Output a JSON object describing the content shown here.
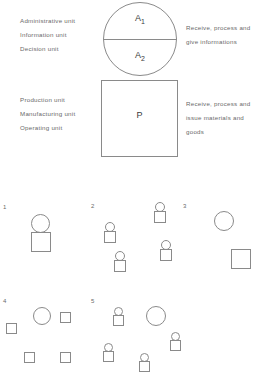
{
  "diagram": {
    "title_shapes": {
      "circle_top_label": "A",
      "circle_top_sub": "1",
      "circle_bottom_label": "A",
      "circle_bottom_sub": "2",
      "square_label": "P"
    },
    "annotations": {
      "left_top": [
        "Administrative unit",
        "Information unit",
        "Decision  unit"
      ],
      "left_bottom": [
        "Production  unit",
        "Manufacturing unit",
        "Operating   unit"
      ],
      "right_top": [
        "Receive, process and",
        "give informations"
      ],
      "right_bottom": [
        "Receive, process and",
        "issue materials and",
        "goods"
      ]
    },
    "colors": {
      "stroke": "#8a8a8a",
      "text": "#6a6a6a",
      "label_text": "#3a3a3a",
      "background": "#ffffff"
    },
    "configurations": [
      {
        "number": "1",
        "num_x": 3,
        "num_y": 14,
        "shapes": [
          {
            "type": "circle",
            "x": 31,
            "y": 24,
            "w": 19,
            "h": 19
          },
          {
            "type": "square",
            "x": 31,
            "y": 42,
            "w": 20,
            "h": 20
          }
        ]
      },
      {
        "number": "2",
        "num_x": 91,
        "num_y": 13,
        "shapes": [
          {
            "type": "circle",
            "x": 155,
            "y": 12,
            "w": 10,
            "h": 10
          },
          {
            "type": "square",
            "x": 154,
            "y": 21,
            "w": 12,
            "h": 12
          },
          {
            "type": "circle",
            "x": 105,
            "y": 32,
            "w": 10,
            "h": 10
          },
          {
            "type": "square",
            "x": 104,
            "y": 41,
            "w": 12,
            "h": 12
          },
          {
            "type": "circle",
            "x": 161,
            "y": 50,
            "w": 10,
            "h": 10
          },
          {
            "type": "square",
            "x": 160,
            "y": 59,
            "w": 12,
            "h": 12
          },
          {
            "type": "circle",
            "x": 115,
            "y": 61,
            "w": 10,
            "h": 10
          },
          {
            "type": "square",
            "x": 114,
            "y": 70,
            "w": 12,
            "h": 12
          }
        ]
      },
      {
        "number": "3",
        "num_x": 183,
        "num_y": 13,
        "shapes": [
          {
            "type": "circle",
            "x": 214,
            "y": 21,
            "w": 20,
            "h": 20
          },
          {
            "type": "square",
            "x": 231,
            "y": 59,
            "w": 20,
            "h": 20
          }
        ]
      },
      {
        "number": "4",
        "num_x": 3,
        "num_y": 108,
        "shapes": [
          {
            "type": "circle",
            "x": 33,
            "y": 117,
            "w": 18,
            "h": 18
          },
          {
            "type": "square",
            "x": 60,
            "y": 122,
            "w": 11,
            "h": 11
          },
          {
            "type": "square",
            "x": 6,
            "y": 133,
            "w": 11,
            "h": 11
          },
          {
            "type": "square",
            "x": 24,
            "y": 162,
            "w": 11,
            "h": 11
          },
          {
            "type": "square",
            "x": 60,
            "y": 162,
            "w": 11,
            "h": 11
          }
        ]
      },
      {
        "number": "5",
        "num_x": 91,
        "num_y": 108,
        "shapes": [
          {
            "type": "circle",
            "x": 146,
            "y": 116,
            "w": 20,
            "h": 20
          },
          {
            "type": "circle",
            "x": 114,
            "y": 117,
            "w": 9,
            "h": 9
          },
          {
            "type": "square",
            "x": 113,
            "y": 125,
            "w": 11,
            "h": 11
          },
          {
            "type": "circle",
            "x": 171,
            "y": 142,
            "w": 9,
            "h": 9
          },
          {
            "type": "square",
            "x": 170,
            "y": 150,
            "w": 11,
            "h": 11
          },
          {
            "type": "circle",
            "x": 104,
            "y": 153,
            "w": 9,
            "h": 9
          },
          {
            "type": "square",
            "x": 103,
            "y": 161,
            "w": 11,
            "h": 11
          },
          {
            "type": "circle",
            "x": 140,
            "y": 163,
            "w": 9,
            "h": 9
          },
          {
            "type": "square",
            "x": 139,
            "y": 171,
            "w": 11,
            "h": 11
          }
        ]
      }
    ]
  }
}
